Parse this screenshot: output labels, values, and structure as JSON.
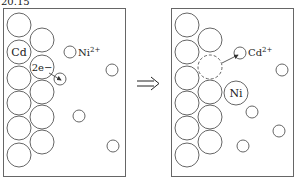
{
  "figure": {
    "label": "20.15",
    "arrow_symbol": "⟹"
  },
  "left_panel": {
    "atom_label": "Cd",
    "electron_label": "2e−",
    "ion_label": "Ni",
    "ion_charge": "2+"
  },
  "right_panel": {
    "ion_label": "Cd",
    "ion_charge": "2+",
    "deposited_atom_label": "Ni"
  },
  "colors": {
    "stroke": "#555555",
    "text": "#222222",
    "background": "#ffffff"
  }
}
